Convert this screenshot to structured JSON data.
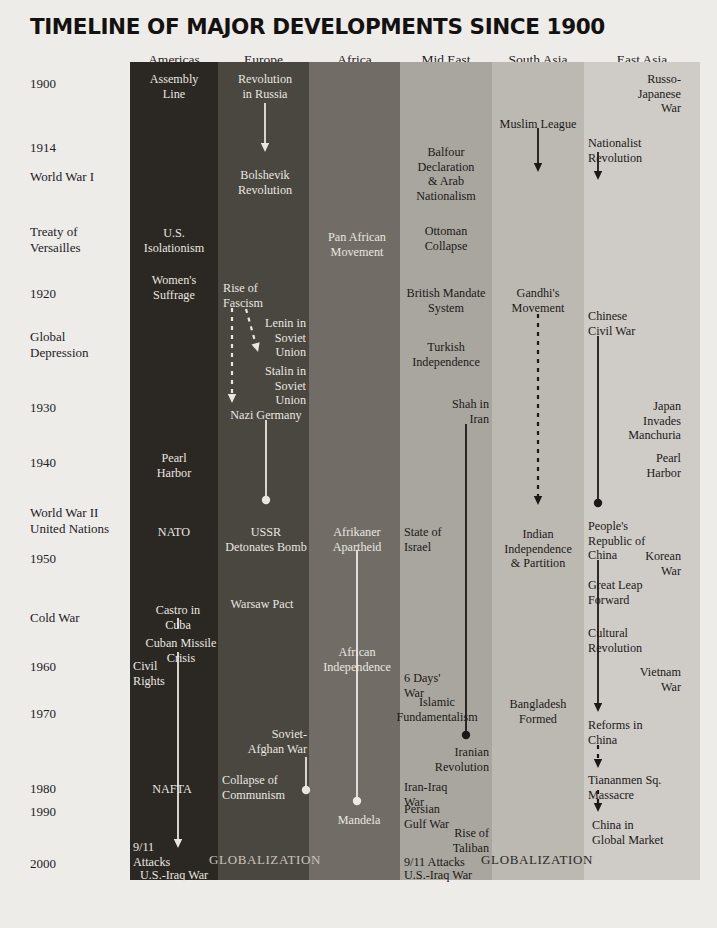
{
  "title": "TIMELINE OF MAJOR DEVELOPMENTS SINCE 1900",
  "page": {
    "background": "#edece8",
    "ink": "#1e1c1a"
  },
  "columns": [
    {
      "key": "americas",
      "label": "Americas",
      "color": "#2b2722",
      "text_color": "#e9e6e0",
      "x": 130,
      "width": 88
    },
    {
      "key": "europe",
      "label": "Europe",
      "color": "#4a4640",
      "text_color": "#e9e6e0",
      "x": 218,
      "width": 91
    },
    {
      "key": "africa",
      "label": "Africa",
      "color": "#716d66",
      "text_color": "#eeebe6",
      "x": 309,
      "width": 91
    },
    {
      "key": "mideast",
      "label": "Mid East",
      "color": "#a9a69f",
      "text_color": "#1b1917",
      "x": 400,
      "width": 92
    },
    {
      "key": "southasia",
      "label": "South Asia",
      "color": "#bcb9b3",
      "text_color": "#1b1917",
      "x": 492,
      "width": 92
    },
    {
      "key": "eastasia",
      "label": "East Asia",
      "color": "#cfccc7",
      "text_color": "#1b1917",
      "x": 584,
      "width": 116
    }
  ],
  "gutter_labels": [
    {
      "text": "1900",
      "y": 76
    },
    {
      "text": "1914",
      "y": 140
    },
    {
      "text": "World War I",
      "y": 169
    },
    {
      "text": "Treaty of\nVersailles",
      "y": 224
    },
    {
      "text": "1920",
      "y": 286
    },
    {
      "text": "Global\nDepression",
      "y": 329
    },
    {
      "text": "1930",
      "y": 400
    },
    {
      "text": "1940",
      "y": 455
    },
    {
      "text": "World War II\nUnited Nations",
      "y": 505
    },
    {
      "text": "1950",
      "y": 551
    },
    {
      "text": "Cold War",
      "y": 610
    },
    {
      "text": "1960",
      "y": 659
    },
    {
      "text": "1970",
      "y": 706
    },
    {
      "text": "1980",
      "y": 781
    },
    {
      "text": "1990",
      "y": 804
    },
    {
      "text": "2000",
      "y": 856
    }
  ],
  "events": {
    "americas": [
      {
        "text": "Assembly\nLine",
        "x": 174,
        "y": 72,
        "align": "c",
        "tone": "light"
      },
      {
        "text": "U.S.\nIsolationism",
        "x": 174,
        "y": 226,
        "align": "c",
        "tone": "light"
      },
      {
        "text": "Women's\nSuffrage",
        "x": 174,
        "y": 273,
        "align": "c",
        "tone": "light"
      },
      {
        "text": "Pearl\nHarbor",
        "x": 174,
        "y": 451,
        "align": "c",
        "tone": "light"
      },
      {
        "text": "NATO",
        "x": 174,
        "y": 525,
        "align": "c",
        "tone": "light"
      },
      {
        "text": "Castro in\nCuba",
        "x": 178,
        "y": 603,
        "align": "c",
        "tone": "light"
      },
      {
        "text": "Cuban Missile\nCrisis",
        "x": 181,
        "y": 636,
        "align": "c",
        "tone": "light"
      },
      {
        "text": "Civil\nRights",
        "x": 133,
        "y": 659,
        "align": "l",
        "tone": "light"
      },
      {
        "text": "NAFTA",
        "x": 172,
        "y": 782,
        "align": "c",
        "tone": "light"
      },
      {
        "text": "9/11\nAttacks",
        "x": 133,
        "y": 840,
        "align": "l",
        "tone": "light"
      },
      {
        "text": "U.S.-Iraq War",
        "x": 140,
        "y": 868,
        "align": "l",
        "tone": "light"
      }
    ],
    "europe": [
      {
        "text": "Revolution\nin Russia",
        "x": 265,
        "y": 72,
        "align": "c",
        "tone": "light"
      },
      {
        "text": "Bolshevik\nRevolution",
        "x": 265,
        "y": 168,
        "align": "c",
        "tone": "light"
      },
      {
        "text": "Rise of\nFascism",
        "x": 223,
        "y": 281,
        "align": "l",
        "tone": "light"
      },
      {
        "text": "Lenin in\nSoviet\nUnion",
        "x": 306,
        "y": 316,
        "align": "r",
        "tone": "light"
      },
      {
        "text": "Stalin in\nSoviet\nUnion",
        "x": 306,
        "y": 364,
        "align": "r",
        "tone": "light"
      },
      {
        "text": "Nazi Germany",
        "x": 266,
        "y": 408,
        "align": "c",
        "tone": "light"
      },
      {
        "text": "USSR\nDetonates Bomb",
        "x": 266,
        "y": 525,
        "align": "c",
        "tone": "light"
      },
      {
        "text": "Warsaw Pact",
        "x": 262,
        "y": 597,
        "align": "c",
        "tone": "light"
      },
      {
        "text": "Soviet-\nAfghan War",
        "x": 307,
        "y": 727,
        "align": "r",
        "tone": "light"
      },
      {
        "text": "Collapse of\nCommunism",
        "x": 222,
        "y": 773,
        "align": "l",
        "tone": "light"
      }
    ],
    "africa": [
      {
        "text": "Pan African\nMovement",
        "x": 357,
        "y": 230,
        "align": "c",
        "tone": "light"
      },
      {
        "text": "Afrikaner\nApartheid",
        "x": 357,
        "y": 525,
        "align": "c",
        "tone": "light"
      },
      {
        "text": "African\nIndependence",
        "x": 357,
        "y": 645,
        "align": "c",
        "tone": "light"
      },
      {
        "text": "Mandela",
        "x": 359,
        "y": 813,
        "align": "c",
        "tone": "light"
      }
    ],
    "mideast": [
      {
        "text": "Balfour\nDeclaration\n& Arab\nNationalism",
        "x": 446,
        "y": 145,
        "align": "c",
        "tone": "dark"
      },
      {
        "text": "Ottoman\nCollapse",
        "x": 446,
        "y": 224,
        "align": "c",
        "tone": "dark"
      },
      {
        "text": "British Mandate\nSystem",
        "x": 446,
        "y": 286,
        "align": "c",
        "tone": "dark"
      },
      {
        "text": "Turkish\nIndependence",
        "x": 446,
        "y": 340,
        "align": "c",
        "tone": "dark"
      },
      {
        "text": "Shah in\nIran",
        "x": 489,
        "y": 397,
        "align": "r",
        "tone": "dark"
      },
      {
        "text": "State of\nIsrael",
        "x": 404,
        "y": 525,
        "align": "l",
        "tone": "dark"
      },
      {
        "text": "6 Days'\nWar",
        "x": 404,
        "y": 671,
        "align": "l",
        "tone": "dark"
      },
      {
        "text": "Islamic\nFundamentalism",
        "x": 437,
        "y": 695,
        "align": "c",
        "tone": "dark"
      },
      {
        "text": "Iranian\nRevolution",
        "x": 489,
        "y": 745,
        "align": "r",
        "tone": "dark"
      },
      {
        "text": "Iran-Iraq\nWar",
        "x": 404,
        "y": 780,
        "align": "l",
        "tone": "dark"
      },
      {
        "text": "Persian\nGulf War",
        "x": 404,
        "y": 802,
        "align": "l",
        "tone": "dark"
      },
      {
        "text": "Rise of\nTaliban",
        "x": 489,
        "y": 826,
        "align": "r",
        "tone": "dark"
      },
      {
        "text": "9/11 Attacks",
        "x": 404,
        "y": 855,
        "align": "l",
        "tone": "dark"
      },
      {
        "text": "U.S.-Iraq War",
        "x": 404,
        "y": 868,
        "align": "l",
        "tone": "dark"
      }
    ],
    "southasia": [
      {
        "text": "Muslim League",
        "x": 538,
        "y": 117,
        "align": "c",
        "tone": "dark"
      },
      {
        "text": "Gandhi's\nMovement",
        "x": 538,
        "y": 286,
        "align": "c",
        "tone": "dark"
      },
      {
        "text": "Indian\nIndependence\n& Partition",
        "x": 538,
        "y": 527,
        "align": "c",
        "tone": "dark"
      },
      {
        "text": "Bangladesh\nFormed",
        "x": 538,
        "y": 697,
        "align": "c",
        "tone": "dark"
      }
    ],
    "eastasia": [
      {
        "text": "Russo-\nJapanese War",
        "x": 681,
        "y": 72,
        "align": "r",
        "tone": "dark"
      },
      {
        "text": "Nationalist\nRevolution",
        "x": 588,
        "y": 136,
        "align": "l",
        "tone": "dark"
      },
      {
        "text": "Chinese\nCivil War",
        "x": 588,
        "y": 309,
        "align": "l",
        "tone": "dark"
      },
      {
        "text": "Japan Invades\nManchuria",
        "x": 681,
        "y": 399,
        "align": "r",
        "tone": "dark"
      },
      {
        "text": "Pearl\nHarbor",
        "x": 681,
        "y": 451,
        "align": "r",
        "tone": "dark"
      },
      {
        "text": "People's\nRepublic of\nChina",
        "x": 588,
        "y": 519,
        "align": "l",
        "tone": "dark"
      },
      {
        "text": "Korean\nWar",
        "x": 681,
        "y": 549,
        "align": "r",
        "tone": "dark"
      },
      {
        "text": "Great Leap\nForward",
        "x": 588,
        "y": 578,
        "align": "l",
        "tone": "dark"
      },
      {
        "text": "Cultural\nRevolution",
        "x": 588,
        "y": 626,
        "align": "l",
        "tone": "dark"
      },
      {
        "text": "Vietnam\nWar",
        "x": 681,
        "y": 665,
        "align": "r",
        "tone": "dark"
      },
      {
        "text": "Reforms in\nChina",
        "x": 588,
        "y": 718,
        "align": "l",
        "tone": "dark"
      },
      {
        "text": "Tiananmen Sq.\nMassacre",
        "x": 588,
        "y": 773,
        "align": "l",
        "tone": "dark"
      },
      {
        "text": "China in\nGlobal Market",
        "x": 592,
        "y": 818,
        "align": "l",
        "tone": "dark"
      }
    ]
  },
  "globalization_labels": [
    {
      "text": "GLOBALIZATION",
      "x": 265,
      "y": 852,
      "tone": "light"
    },
    {
      "text": "GLOBALIZATION",
      "x": 537,
      "y": 852,
      "tone": "dark"
    }
  ],
  "connectors": [
    {
      "name": "europe-revolution-to-bolshevik",
      "column": "europe",
      "x": 265,
      "y1": 103,
      "y2": 152,
      "style": "solid",
      "head": "arrow",
      "tail": "none",
      "color": "#e9e6e0"
    },
    {
      "name": "europe-fascism-to-nazi",
      "column": "europe",
      "x": 232,
      "y1": 308,
      "y2": 403,
      "style": "dashed",
      "head": "arrow",
      "tail": "none",
      "color": "#e9e6e0"
    },
    {
      "name": "europe-lenin-to-stalin",
      "column": "europe",
      "x": 246,
      "y1": 309,
      "y2": 352,
      "style": "dashed",
      "head": "arrow",
      "tail": "none",
      "color": "#e9e6e0",
      "slant": 12
    },
    {
      "name": "europe-nazi-to-ussr-bomb",
      "column": "europe",
      "x": 266,
      "y1": 420,
      "y2": 500,
      "style": "solid",
      "head": "dot",
      "tail": "none",
      "color": "#e9e6e0"
    },
    {
      "name": "europe-afghan-war-end",
      "column": "europe",
      "x": 306,
      "y1": 757,
      "y2": 790,
      "style": "solid",
      "head": "dot",
      "tail": "none",
      "color": "#e9e6e0"
    },
    {
      "name": "americas-castro-to-crisis",
      "column": "americas",
      "x": 178,
      "y1": 618,
      "y2": 628,
      "style": "solid",
      "head": "none",
      "tail": "none",
      "color": "#e9e6e0"
    },
    {
      "name": "americas-crisis-to-2001",
      "column": "americas",
      "x": 178,
      "y1": 652,
      "y2": 848,
      "style": "solid",
      "head": "arrow",
      "tail": "none",
      "color": "#e9e6e0"
    },
    {
      "name": "africa-apartheid-to-mandela",
      "column": "africa",
      "x": 357,
      "y1": 550,
      "y2": 801,
      "style": "solid",
      "head": "dot",
      "tail": "none",
      "color": "#eeebe6"
    },
    {
      "name": "mideast-shah-to-revolution",
      "column": "mideast",
      "x": 466,
      "y1": 424,
      "y2": 735,
      "style": "solid",
      "head": "dot",
      "tail": "none",
      "color": "#1b1917"
    },
    {
      "name": "southasia-muslim-league-arrow",
      "column": "southasia",
      "x": 538,
      "y1": 128,
      "y2": 172,
      "style": "solid",
      "head": "arrow",
      "tail": "none",
      "color": "#1b1917"
    },
    {
      "name": "southasia-gandhi-to-partition",
      "column": "southasia",
      "x": 538,
      "y1": 314,
      "y2": 505,
      "style": "dashed",
      "head": "arrow",
      "tail": "none",
      "color": "#1b1917"
    },
    {
      "name": "eastasia-nationalist-arrow",
      "column": "eastasia",
      "x": 598,
      "y1": 152,
      "y2": 180,
      "style": "solid",
      "head": "arrow",
      "tail": "none",
      "color": "#1b1917"
    },
    {
      "name": "eastasia-civilwar-to-prc",
      "column": "eastasia",
      "x": 598,
      "y1": 336,
      "y2": 503,
      "style": "solid",
      "head": "dot",
      "tail": "none",
      "color": "#1b1917"
    },
    {
      "name": "eastasia-prc-to-reforms",
      "column": "eastasia",
      "x": 598,
      "y1": 560,
      "y2": 712,
      "style": "solid",
      "head": "arrow",
      "tail": "none",
      "color": "#1b1917"
    },
    {
      "name": "eastasia-reforms-to-tiananmen",
      "column": "eastasia",
      "x": 598,
      "y1": 745,
      "y2": 768,
      "style": "dashed",
      "head": "arrow",
      "tail": "none",
      "color": "#1b1917"
    },
    {
      "name": "eastasia-tiananmen-to-market",
      "column": "eastasia",
      "x": 598,
      "y1": 790,
      "y2": 812,
      "style": "dashed",
      "head": "arrow",
      "tail": "none",
      "color": "#1b1917"
    }
  ]
}
